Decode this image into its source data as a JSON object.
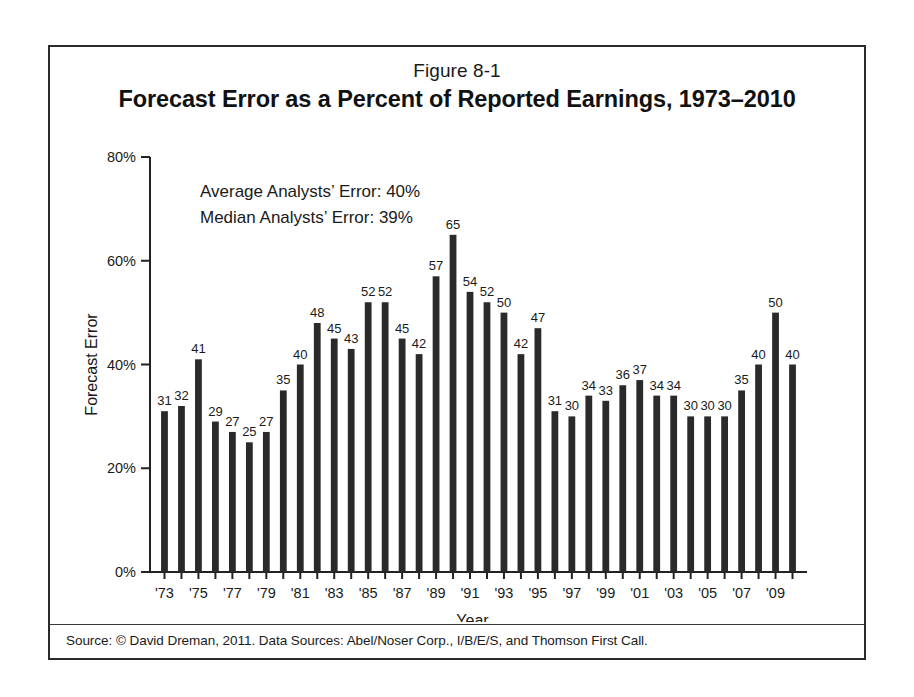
{
  "figure": {
    "number": "Figure 8-1",
    "title": "Forecast Error as a Percent of Reported Earnings, 1973–2010",
    "source": "Source: © David Dreman, 2011. Data Sources: Abel/Noser Corp., I/B/E/S, and Thomson First Call."
  },
  "annotations": {
    "average_error": "Average Analysts’ Error: 40%",
    "median_error": "Median Analysts’ Error: 39%"
  },
  "colors": {
    "bar": "#2a2a2a",
    "axis": "#222222",
    "frame": "#2b2b2b",
    "text": "#1a1a1a"
  },
  "chart_data": {
    "type": "bar",
    "title": "Forecast Error as a Percent of Reported Earnings, 1973–2010",
    "subtitle": "Figure 8-1",
    "xlabel": "Year",
    "ylabel": "Forecast Error",
    "ylim": [
      0,
      80
    ],
    "yticks": [
      0,
      20,
      40,
      60,
      80
    ],
    "ytick_labels": [
      "0%",
      "20%",
      "40%",
      "60%",
      "80%"
    ],
    "grid": false,
    "legend": "none",
    "categories": [
      "1973",
      "1974",
      "1975",
      "1976",
      "1977",
      "1978",
      "1979",
      "1980",
      "1981",
      "1982",
      "1983",
      "1984",
      "1985",
      "1986",
      "1987",
      "1988",
      "1989",
      "1990",
      "1991",
      "1992",
      "1993",
      "1994",
      "1995",
      "1996",
      "1997",
      "1998",
      "1999",
      "2000",
      "2001",
      "2002",
      "2003",
      "2004",
      "2005",
      "2006",
      "2007",
      "2008",
      "2009",
      "2010"
    ],
    "xtick_labels": [
      "'73",
      "",
      "'75",
      "",
      "'77",
      "",
      "'79",
      "",
      "'81",
      "",
      "'83",
      "",
      "'85",
      "",
      "'87",
      "",
      "'89",
      "",
      "'91",
      "",
      "'93",
      "",
      "'95",
      "",
      "'97",
      "",
      "'99",
      "",
      "'01",
      "",
      "'03",
      "",
      "'05",
      "",
      "'07",
      "",
      "'09",
      ""
    ],
    "values": [
      31,
      32,
      41,
      29,
      27,
      25,
      27,
      35,
      40,
      48,
      45,
      43,
      52,
      52,
      45,
      42,
      57,
      65,
      54,
      52,
      50,
      42,
      47,
      31,
      30,
      34,
      33,
      36,
      37,
      34,
      34,
      30,
      30,
      30,
      35,
      40,
      50,
      40
    ],
    "value_labels": [
      "31",
      "32",
      "41",
      "29",
      "27",
      "25",
      "27",
      "35",
      "40",
      "48",
      "45",
      "43",
      "52",
      "52",
      "45",
      "42",
      "57",
      "65",
      "54",
      "52",
      "50",
      "42",
      "47",
      "31",
      "30",
      "34",
      "33",
      "36",
      "37",
      "34",
      "34",
      "30",
      "30",
      "30",
      "35",
      "40",
      "50",
      "40"
    ],
    "annotations": [
      "Average Analysts’ Error: 40%",
      "Median Analysts’ Error: 39%"
    ]
  }
}
